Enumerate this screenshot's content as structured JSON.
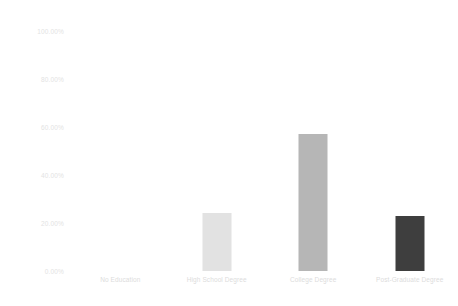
{
  "chart_data": {
    "type": "bar",
    "title": "",
    "subtitle": "",
    "xlabel": "",
    "ylabel": "",
    "categories": [
      "No Education",
      "High School Degree",
      "College Degree",
      "Post-Graduate Degree"
    ],
    "values": [
      0,
      24,
      57,
      23
    ],
    "value_labels": [
      "0.00%",
      "24.00%",
      "57.00%",
      "23.00%"
    ],
    "series": [
      {
        "name": "",
        "values": [
          0,
          24,
          57,
          23
        ]
      }
    ],
    "ylim": [
      0,
      100
    ],
    "ytick_values": [
      0,
      20,
      40,
      60,
      80,
      100
    ],
    "ytick_labels": [
      "0.00%",
      "20.00%",
      "40.00%",
      "60.00%",
      "80.00%",
      "100.00%"
    ],
    "grid": false,
    "legend": false,
    "legend_position": "none",
    "bar_colors": [
      "#ffffff",
      "#e2e2e2",
      "#b6b6b6",
      "#3e3e3e"
    ],
    "background_color": "#ffffff",
    "tick_label_color": "#e0e0e0"
  }
}
